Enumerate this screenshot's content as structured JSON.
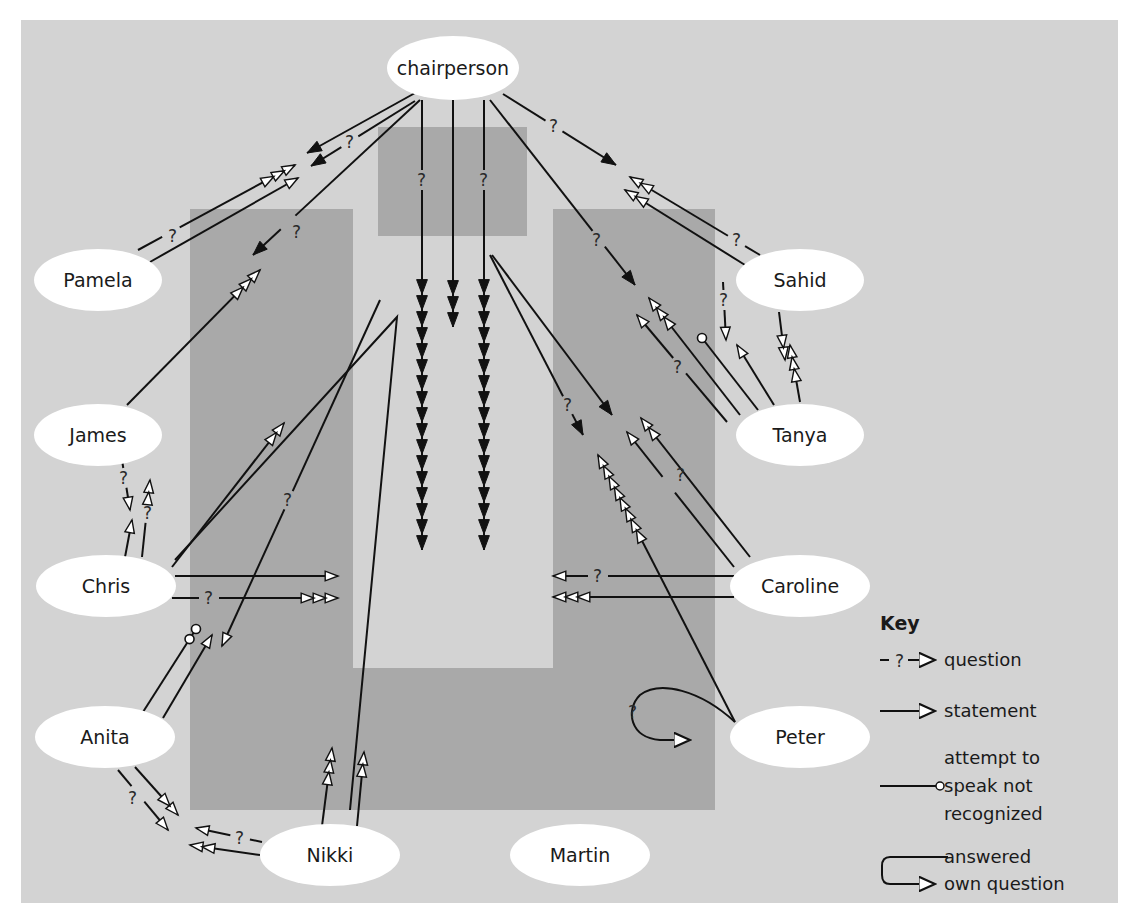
{
  "colors": {
    "panel": "#d3d3d3",
    "table": "#a9a9a9",
    "ellipse": "#ffffff",
    "ink": "#111111"
  },
  "table_shapes": {
    "head_box": {
      "x": 378,
      "y": 127,
      "w": 149,
      "h": 109
    },
    "left_arm": {
      "x": 190,
      "y": 209,
      "w": 163,
      "h": 601
    },
    "right_arm": {
      "x": 553,
      "y": 209,
      "w": 162,
      "h": 601
    },
    "bottom": {
      "x": 190,
      "y": 668,
      "w": 525,
      "h": 142
    }
  },
  "participants": [
    {
      "id": "chairperson",
      "label": "chairperson",
      "cx": 453,
      "cy": 68,
      "rx": 66,
      "ry": 32
    },
    {
      "id": "pamela",
      "label": "Pamela",
      "cx": 98,
      "cy": 280,
      "rx": 64,
      "ry": 31
    },
    {
      "id": "james",
      "label": "James",
      "cx": 98,
      "cy": 435,
      "rx": 64,
      "ry": 31
    },
    {
      "id": "chris",
      "label": "Chris",
      "cx": 106,
      "cy": 586,
      "rx": 70,
      "ry": 31
    },
    {
      "id": "anita",
      "label": "Anita",
      "cx": 105,
      "cy": 737,
      "rx": 70,
      "ry": 31
    },
    {
      "id": "nikki",
      "label": "Nikki",
      "cx": 330,
      "cy": 855,
      "rx": 70,
      "ry": 31
    },
    {
      "id": "martin",
      "label": "Martin",
      "cx": 580,
      "cy": 855,
      "rx": 70,
      "ry": 31
    },
    {
      "id": "peter",
      "label": "Peter",
      "cx": 800,
      "cy": 737,
      "rx": 70,
      "ry": 31
    },
    {
      "id": "caroline",
      "label": "Caroline",
      "cx": 800,
      "cy": 586,
      "rx": 70,
      "ry": 31
    },
    {
      "id": "tanya",
      "label": "Tanya",
      "cx": 800,
      "cy": 435,
      "rx": 64,
      "ry": 31
    },
    {
      "id": "sahid",
      "label": "Sahid",
      "cx": 800,
      "cy": 280,
      "rx": 64,
      "ry": 31
    }
  ],
  "interactions": [
    {
      "from": "chairperson",
      "to": "pamela",
      "type": "statement",
      "count": 1,
      "path": [
        [
          415,
          93
        ],
        [
          307,
          153
        ]
      ]
    },
    {
      "from": "chairperson",
      "to": "pamela",
      "type": "question",
      "count": 1,
      "path": [
        [
          415,
          101
        ],
        [
          311,
          166
        ]
      ],
      "q": [
        350,
        142
      ]
    },
    {
      "from": "chairperson",
      "to": "james",
      "type": "question",
      "count": 1,
      "path": [
        [
          420,
          100
        ],
        [
          253,
          255
        ]
      ],
      "q": [
        297,
        232
      ]
    },
    {
      "from": "pamela",
      "to": "chairperson",
      "type": "question",
      "count": 3,
      "path": [
        [
          138,
          250
        ],
        [
          295,
          165
        ]
      ],
      "q": [
        173,
        236
      ]
    },
    {
      "from": "pamela",
      "to": "chairperson",
      "type": "statement",
      "count": 1,
      "path": [
        [
          150,
          262
        ],
        [
          298,
          178
        ]
      ]
    },
    {
      "from": "james",
      "to": "chairperson",
      "type": "statement",
      "count": 3,
      "path": [
        [
          127,
          405
        ],
        [
          260,
          270
        ]
      ]
    },
    {
      "from": "chairperson",
      "to": "group",
      "type": "question",
      "count": 17,
      "path": [
        [
          422,
          100
        ],
        [
          422,
          550
        ]
      ],
      "q": [
        422,
        180
      ]
    },
    {
      "from": "chairperson",
      "to": "group",
      "type": "statement",
      "count": 3,
      "path": [
        [
          453,
          100
        ],
        [
          453,
          327
        ]
      ]
    },
    {
      "from": "chairperson",
      "to": "group",
      "type": "question",
      "count": 17,
      "path": [
        [
          484,
          100
        ],
        [
          484,
          550
        ]
      ],
      "q": [
        484,
        180
      ]
    },
    {
      "from": "chairperson",
      "to": "sahid",
      "type": "question",
      "count": 1,
      "path": [
        [
          503,
          94
        ],
        [
          616,
          165
        ]
      ],
      "q": [
        554,
        126
      ]
    },
    {
      "from": "chairperson",
      "to": "tanya",
      "type": "question",
      "count": 1,
      "path": [
        [
          490,
          100
        ],
        [
          635,
          285
        ]
      ],
      "q": [
        597,
        240
      ]
    },
    {
      "from": "chairperson",
      "to": "caroline",
      "type": "question",
      "count": 1,
      "path": [
        [
          490,
          255
        ],
        [
          583,
          435
        ]
      ],
      "q": [
        568,
        405
      ]
    },
    {
      "from": "chairperson",
      "to": "caroline",
      "type": "statement",
      "count": 1,
      "path": [
        [
          492,
          255
        ],
        [
          612,
          415
        ]
      ]
    },
    {
      "from": "sahid",
      "to": "chairperson",
      "type": "question",
      "count": 2,
      "path": [
        [
          760,
          255
        ],
        [
          630,
          177
        ]
      ],
      "q": [
        737,
        240
      ]
    },
    {
      "from": "sahid",
      "to": "chairperson",
      "type": "statement",
      "count": 2,
      "path": [
        [
          745,
          265
        ],
        [
          625,
          190
        ]
      ]
    },
    {
      "from": "sahid",
      "to": "tanya",
      "type": "question",
      "count": 1,
      "path": [
        [
          723,
          282
        ],
        [
          726,
          340
        ]
      ],
      "q": [
        724,
        300
      ]
    },
    {
      "from": "sahid",
      "to": "tanya",
      "type": "statement",
      "count": 2,
      "path": [
        [
          779,
          312
        ],
        [
          785,
          360
        ]
      ]
    },
    {
      "from": "tanya",
      "to": "sahid",
      "type": "statement",
      "count": 3,
      "path": [
        [
          800,
          402
        ],
        [
          790,
          345
        ]
      ]
    },
    {
      "from": "tanya",
      "to": "chairperson",
      "type": "statement",
      "count": 1,
      "path": [
        [
          774,
          405
        ],
        [
          737,
          345
        ]
      ]
    },
    {
      "from": "tanya",
      "to": "chairperson",
      "type": "attempt",
      "count": 1,
      "path": [
        [
          758,
          410
        ],
        [
          702,
          338
        ]
      ]
    },
    {
      "from": "tanya",
      "to": "chairperson",
      "type": "statement",
      "count": 3,
      "path": [
        [
          740,
          415
        ],
        [
          649,
          298
        ]
      ]
    },
    {
      "from": "tanya",
      "to": "chairperson",
      "type": "question",
      "count": 1,
      "path": [
        [
          727,
          422
        ],
        [
          637,
          315
        ]
      ],
      "q": [
        678,
        367
      ]
    },
    {
      "from": "caroline",
      "to": "chairperson",
      "type": "statement",
      "count": 2,
      "path": [
        [
          750,
          557
        ],
        [
          641,
          418
        ]
      ]
    },
    {
      "from": "caroline",
      "to": "chairperson",
      "type": "question",
      "count": 1,
      "path": [
        [
          734,
          567
        ],
        [
          627,
          432
        ]
      ],
      "q": [
        681,
        475
      ]
    },
    {
      "from": "caroline",
      "to": "chris",
      "type": "question",
      "count": 1,
      "path": [
        [
          734,
          576
        ],
        [
          553,
          576
        ]
      ],
      "q": [
        598,
        576
      ]
    },
    {
      "from": "caroline",
      "to": "chris",
      "type": "statement",
      "count": 3,
      "path": [
        [
          734,
          597
        ],
        [
          553,
          597
        ]
      ]
    },
    {
      "from": "peter",
      "to": "chairperson",
      "type": "statement",
      "count": 8,
      "path": [
        [
          735,
          722
        ],
        [
          598,
          455
        ]
      ]
    },
    {
      "from": "peter",
      "to": "peter",
      "type": "own-question",
      "count": 1,
      "q": [
        634,
        712
      ]
    },
    {
      "from": "chris",
      "to": "caroline",
      "type": "statement",
      "count": 1,
      "path": [
        [
          175,
          576
        ],
        [
          338,
          576
        ]
      ]
    },
    {
      "from": "chris",
      "to": "caroline",
      "type": "question",
      "count": 3,
      "path": [
        [
          172,
          598
        ],
        [
          338,
          598
        ]
      ],
      "q": [
        209,
        598
      ]
    },
    {
      "from": "chris",
      "to": "chairperson",
      "type": "statement",
      "count": 2,
      "path": [
        [
          172,
          567
        ],
        [
          284,
          423
        ]
      ]
    },
    {
      "from": "chris",
      "to": "group",
      "type": "statement",
      "count": 0,
      "path": [
        [
          175,
          560
        ],
        [
          397,
          317
        ],
        [
          350,
          810
        ]
      ]
    },
    {
      "from": "nikki",
      "to": "chris",
      "type": "question",
      "count": 1,
      "path": [
        [
          380,
          300
        ],
        [
          222,
          646
        ]
      ],
      "q": [
        288,
        500
      ]
    },
    {
      "from": "chris",
      "to": "james",
      "type": "question",
      "count": 2,
      "path": [
        [
          142,
          557
        ],
        [
          150,
          480
        ]
      ],
      "q": [
        148,
        513
      ]
    },
    {
      "from": "james",
      "to": "chris",
      "type": "question",
      "count": 1,
      "path": [
        [
          122,
          460
        ],
        [
          130,
          510
        ]
      ],
      "q": [
        124,
        478
      ]
    },
    {
      "from": "chris",
      "to": "james",
      "type": "statement",
      "count": 1,
      "path": [
        [
          125,
          557
        ],
        [
          132,
          520
        ]
      ]
    },
    {
      "from": "anita",
      "to": "chris",
      "type": "attempt",
      "count": 2,
      "path": [
        [
          143,
          712
        ],
        [
          196,
          629
        ]
      ]
    },
    {
      "from": "anita",
      "to": "chris",
      "type": "statement",
      "count": 1,
      "path": [
        [
          163,
          718
        ],
        [
          212,
          635
        ]
      ]
    },
    {
      "from": "anita",
      "to": "nikki",
      "type": "statement",
      "count": 2,
      "path": [
        [
          135,
          767
        ],
        [
          178,
          815
        ]
      ]
    },
    {
      "from": "anita",
      "to": "nikki",
      "type": "question",
      "count": 1,
      "path": [
        [
          118,
          770
        ],
        [
          168,
          830
        ]
      ],
      "q": [
        133,
        798
      ]
    },
    {
      "from": "nikki",
      "to": "anita",
      "type": "question",
      "count": 1,
      "path": [
        [
          262,
          842
        ],
        [
          196,
          828
        ]
      ],
      "q": [
        240,
        838
      ]
    },
    {
      "from": "nikki",
      "to": "anita",
      "type": "statement",
      "count": 2,
      "path": [
        [
          260,
          855
        ],
        [
          190,
          845
        ]
      ]
    },
    {
      "from": "nikki",
      "to": "group",
      "type": "statement",
      "count": 3,
      "path": [
        [
          322,
          826
        ],
        [
          332,
          748
        ]
      ]
    },
    {
      "from": "nikki",
      "to": "group",
      "type": "statement",
      "count": 2,
      "path": [
        [
          357,
          826
        ],
        [
          364,
          752
        ]
      ]
    }
  ],
  "key": {
    "title": "Key",
    "items": [
      {
        "symbol": "question",
        "label_lines": [
          "question"
        ]
      },
      {
        "symbol": "statement",
        "label_lines": [
          "statement"
        ]
      },
      {
        "symbol": "attempt",
        "label_lines": [
          "attempt to",
          "speak not",
          "recognized"
        ]
      },
      {
        "symbol": "own-question",
        "label_lines": [
          "answered",
          "own question"
        ]
      }
    ]
  }
}
